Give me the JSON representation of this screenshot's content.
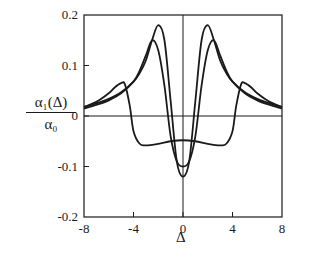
{
  "chart_data": {
    "type": "line",
    "title": "",
    "xlabel": "Δ",
    "ylabel": "α1(Δ) / α0",
    "ylabel_numerator": "α₁(Δ)",
    "ylabel_denominator": "α₀",
    "xlim": [
      -8,
      8
    ],
    "ylim": [
      -0.2,
      0.2
    ],
    "xticks": [
      -8,
      -4,
      0,
      4,
      8
    ],
    "xtick_labels": [
      "-8",
      "-4",
      "0",
      "4",
      "8"
    ],
    "yticks": [
      -0.2,
      -0.1,
      0,
      0.1,
      0.2
    ],
    "ytick_labels": [
      "-0.2",
      "-0.1",
      "0",
      "0.1",
      "0.2"
    ],
    "grid": false,
    "legend": null,
    "reference_lines": {
      "x": 0,
      "y": 0
    },
    "series": [
      {
        "name": "curve-1",
        "x": [
          -8,
          -7,
          -6,
          -5,
          -4,
          -3.5,
          -3,
          -2.5,
          -2,
          -1.5,
          -1,
          -0.5,
          0,
          0.5,
          1,
          1.5,
          2,
          2.5,
          3,
          3.5,
          4,
          5,
          6,
          7,
          8
        ],
        "values": [
          0.018,
          0.025,
          0.034,
          0.047,
          0.068,
          0.085,
          0.11,
          0.15,
          0.18,
          0.15,
          0.03,
          -0.09,
          -0.12,
          -0.09,
          0.03,
          0.15,
          0.18,
          0.15,
          0.11,
          0.085,
          0.068,
          0.047,
          0.034,
          0.025,
          0.018
        ]
      },
      {
        "name": "curve-2",
        "x": [
          -8,
          -7,
          -6,
          -5,
          -4,
          -3.5,
          -3,
          -2.5,
          -2,
          -1.5,
          -1,
          -0.5,
          0,
          0.5,
          1,
          1.5,
          2,
          2.5,
          3,
          3.5,
          4,
          5,
          6,
          7,
          8
        ],
        "values": [
          0.015,
          0.022,
          0.031,
          0.045,
          0.068,
          0.09,
          0.12,
          0.15,
          0.13,
          0.06,
          -0.04,
          -0.09,
          -0.1,
          -0.09,
          -0.04,
          0.06,
          0.13,
          0.15,
          0.12,
          0.09,
          0.068,
          0.045,
          0.031,
          0.022,
          0.015
        ]
      },
      {
        "name": "curve-3",
        "x": [
          -8,
          -7,
          -6,
          -5.5,
          -5,
          -4.7,
          -4.3,
          -4,
          -3.5,
          -3,
          -2,
          -1,
          0,
          1,
          2,
          3,
          3.5,
          4,
          4.3,
          4.7,
          5,
          5.5,
          6,
          7,
          8
        ],
        "values": [
          0.018,
          0.028,
          0.045,
          0.057,
          0.065,
          0.063,
          0.02,
          -0.03,
          -0.055,
          -0.058,
          -0.055,
          -0.05,
          -0.048,
          -0.05,
          -0.055,
          -0.058,
          -0.055,
          -0.03,
          0.02,
          0.063,
          0.065,
          0.057,
          0.045,
          0.028,
          0.018
        ]
      }
    ]
  }
}
